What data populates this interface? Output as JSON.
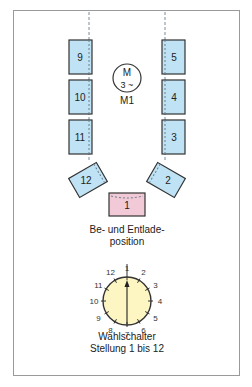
{
  "colors": {
    "box_fill": "#bfe3f5",
    "box_stroke": "#333333",
    "load_box_fill": "#f2c9d6",
    "dial_fill": "#fdf6c3",
    "frame_stroke": "#9a9a9a",
    "dash": "#7a8c99"
  },
  "motor": {
    "symbol_top": "M",
    "symbol_bottom": "3 ~",
    "label": "M1"
  },
  "positions": {
    "left_column": [
      "9",
      "10",
      "11"
    ],
    "right_column": [
      "5",
      "4",
      "3"
    ],
    "left_angled": "12",
    "right_angled": "2",
    "bottom": "1"
  },
  "load_label": {
    "line1": "Be- und Entlade-",
    "line2": "position"
  },
  "selector": {
    "numbers": [
      "1",
      "2",
      "3",
      "4",
      "5",
      "6",
      "7",
      "8",
      "9",
      "10",
      "11",
      "12"
    ],
    "label_line1": "Wahlschalter",
    "label_line2": "Stellung 1 bis 12",
    "selected": "1"
  }
}
